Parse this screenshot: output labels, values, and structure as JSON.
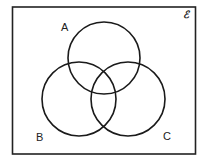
{
  "diagram": {
    "type": "venn",
    "universal_set_label": "ℰ",
    "sets": [
      {
        "name": "A",
        "label": "A"
      },
      {
        "name": "B",
        "label": "B"
      },
      {
        "name": "C",
        "label": "C"
      }
    ]
  }
}
